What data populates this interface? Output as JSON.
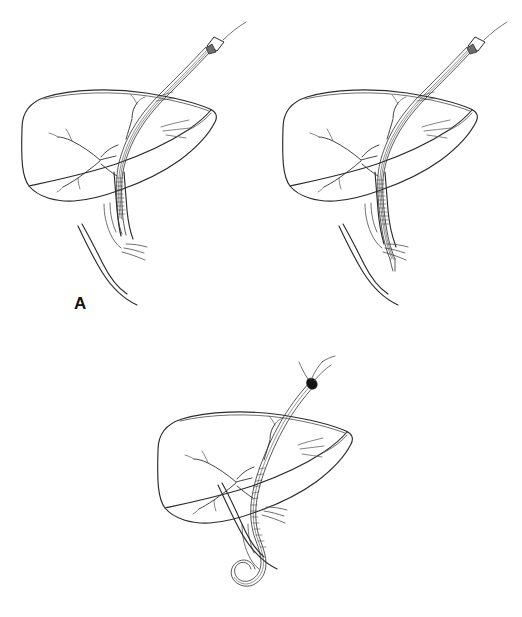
{
  "figure": {
    "type": "medical-line-illustration",
    "background_color": "#ffffff",
    "ink_color": "#2b2b2b",
    "width": 522,
    "height": 617,
    "panel_count": 3
  },
  "panels": [
    {
      "id": "a",
      "label": "A",
      "label_position": {
        "x": 74,
        "y": 295
      },
      "catheter": {
        "name": "external-biliary-drainage-catheter",
        "has_hub": true,
        "hub_position": "upper-right",
        "tip_location": "common-bile-duct",
        "has_pigtail_coil": false
      },
      "anatomy": [
        "liver-outline",
        "intrahepatic-biliary-tree",
        "hepatic-duct-confluence",
        "common-bile-duct",
        "cystic-duct",
        "duodenal-c-loop"
      ]
    },
    {
      "id": "b",
      "label": "B",
      "label_position": {
        "x": 333,
        "y": 295
      },
      "catheter": {
        "name": "external-internal-drainage-catheter",
        "has_hub": true,
        "hub_position": "upper-right",
        "tip_location": "distal-common-bile-duct",
        "has_pigtail_coil": false
      },
      "anatomy": [
        "liver-outline",
        "intrahepatic-biliary-tree",
        "hepatic-duct-confluence",
        "common-bile-duct",
        "cystic-duct",
        "duodenal-c-loop"
      ]
    },
    {
      "id": "c",
      "label": "C",
      "label_position": {
        "x": 210,
        "y": 562
      },
      "catheter": {
        "name": "internal-external-pigtail-catheter",
        "has_hub": false,
        "hub_position": "none",
        "tip_location": "duodenum",
        "has_pigtail_coil": true
      },
      "anatomy": [
        "liver-outline",
        "intrahepatic-biliary-tree",
        "hepatic-duct-confluence",
        "common-bile-duct",
        "cystic-duct",
        "duodenal-c-loop",
        "percutaneous-puncture-site"
      ]
    }
  ],
  "icons": {
    "catheter_hub": "catheter-hub-icon",
    "pigtail_loop": "pigtail-coil-icon",
    "puncture_site": "puncture-site-icon"
  }
}
